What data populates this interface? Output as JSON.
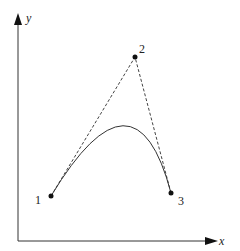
{
  "diagram": {
    "axes": {
      "x_label": "x",
      "y_label": "y"
    },
    "points": [
      {
        "id": "p1",
        "label": "1",
        "x": 51,
        "y": 196
      },
      {
        "id": "p2",
        "label": "2",
        "x": 135,
        "y": 57
      },
      {
        "id": "p3",
        "label": "3",
        "x": 171,
        "y": 193
      }
    ],
    "colors": {
      "stroke": "#333333",
      "background": "#ffffff"
    }
  }
}
